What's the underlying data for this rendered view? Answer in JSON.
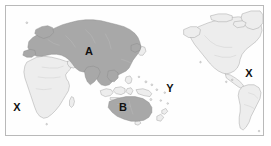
{
  "figure": {
    "type": "world-map",
    "projection": "pacific-centered equirectangular",
    "width": 271,
    "height": 146
  },
  "colors": {
    "ocean": "#fefefe",
    "land_unshaded": "#ededed",
    "land_shaded": "#a8a8a8",
    "coastline": "#9a9a9a",
    "border_internal": "#c8c8c8",
    "frame": "#b9b9b9",
    "label_text": "#111111"
  },
  "legend_labels": [
    {
      "id": "label-a",
      "text": "A",
      "kind": "region-label",
      "region": "Eurasia",
      "shaded": true,
      "x": 88,
      "y": 50
    },
    {
      "id": "label-b",
      "text": "B",
      "kind": "region-label",
      "region": "Australia",
      "shaded": true,
      "x": 122,
      "y": 106
    },
    {
      "id": "label-y",
      "text": "Y",
      "kind": "ocean-marker",
      "region": "Pacific Ocean",
      "shaded": false,
      "x": 169,
      "y": 87
    },
    {
      "id": "label-x-left",
      "text": "X",
      "kind": "ocean-marker",
      "region": "South Atlantic Ocean",
      "shaded": false,
      "x": 16,
      "y": 106
    },
    {
      "id": "label-x-right",
      "text": "X",
      "kind": "ocean-marker",
      "region": "North Atlantic Ocean",
      "shaded": false,
      "x": 248,
      "y": 72
    }
  ]
}
